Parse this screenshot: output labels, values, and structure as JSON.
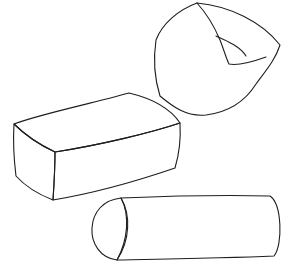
{
  "illustration": {
    "title": "Cushion shapes",
    "shapes": [
      {
        "name": "round-pouf",
        "type": "rounded cushion"
      },
      {
        "name": "rectangular-block",
        "type": "box cushion"
      },
      {
        "name": "bolster-cylinder",
        "type": "cylinder cushion"
      }
    ],
    "colors": {
      "fill_light": "#d4d4d4",
      "fill_mid": "#bdbdbd",
      "fill_dark": "#a9a9a9",
      "outline": "#1e1e1e",
      "background": "#ffffff"
    }
  }
}
